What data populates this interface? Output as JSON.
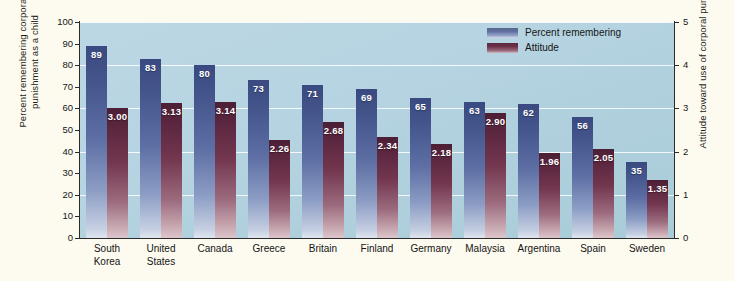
{
  "chart_data": {
    "type": "bar",
    "title": "",
    "categories": [
      "South\nKorea",
      "United\nStates",
      "Canada",
      "Greece",
      "Britain",
      "Finland",
      "Germany",
      "Malaysia",
      "Argentina",
      "Spain",
      "Sweden"
    ],
    "series": [
      {
        "name": "Percent remembering",
        "color": "#44558c",
        "axis": "left",
        "values": [
          89,
          83,
          80,
          73,
          71,
          69,
          65,
          63,
          62,
          56,
          35
        ],
        "value_labels": [
          "89",
          "83",
          "80",
          "73",
          "71",
          "69",
          "65",
          "63",
          "62",
          "56",
          "35"
        ]
      },
      {
        "name": "Attitude",
        "color": "#5c2740",
        "axis": "right",
        "values": [
          3.0,
          3.13,
          3.14,
          2.26,
          2.68,
          2.34,
          2.18,
          2.9,
          1.96,
          2.05,
          1.35
        ],
        "value_labels": [
          "3.00",
          "3.13",
          "3.14",
          "2.26",
          "2.68",
          "2.34",
          "2.18",
          "2.90",
          "1.96",
          "2.05",
          "1.35"
        ]
      }
    ],
    "xlabel": "",
    "ylabel_left": "Percent remembering corporal\npunishment as a child",
    "ylabel_right": "Attitude toward use of corporal punishment",
    "ylim_left": [
      0,
      100
    ],
    "ylim_right": [
      0,
      5
    ],
    "yticks_left": [
      "0",
      "10",
      "20",
      "30",
      "40",
      "50",
      "60",
      "70",
      "80",
      "90",
      "100"
    ],
    "yticks_right": [
      "0",
      "1",
      "2",
      "3",
      "4",
      "5"
    ],
    "gridlines_at_left": [
      20,
      40,
      60,
      80,
      100
    ],
    "grid": true,
    "legend_position": "top-right",
    "plot_background": "#b4d1df",
    "figure_background": "#fdfbf0"
  },
  "legend": {
    "items": [
      {
        "label": "Percent remembering",
        "swatch": "sw-pct"
      },
      {
        "label": "Attitude",
        "swatch": "sw-att"
      }
    ]
  }
}
